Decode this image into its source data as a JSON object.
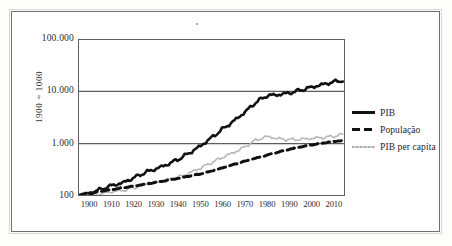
{
  "chart_data": {
    "type": "line",
    "title": "",
    "xlabel": "",
    "ylabel": "1900 = 1000",
    "y_scale": "log",
    "grid": true,
    "legend_position": "right",
    "xlim": [
      1895,
      2015
    ],
    "ylim": [
      100,
      100000
    ],
    "y_ticks": [
      100,
      1000,
      10000,
      100000
    ],
    "y_tick_labels": [
      "100",
      "1.000",
      "10.000",
      "100.000"
    ],
    "x_ticks": [
      1900,
      1910,
      1920,
      1930,
      1940,
      1950,
      1960,
      1970,
      1980,
      1990,
      2000,
      2010
    ],
    "x_tick_labels": [
      "1900",
      "1910",
      "1920",
      "1930",
      "1940",
      "1950",
      "1960",
      "1970",
      "1980",
      "1990",
      "2000",
      "2010"
    ],
    "series": [
      {
        "name": "PIB",
        "style": "solid",
        "color": "#111111",
        "width": 2.6,
        "x": [
          1895,
          1900,
          1905,
          1910,
          1915,
          1920,
          1925,
          1930,
          1935,
          1940,
          1945,
          1950,
          1955,
          1960,
          1965,
          1970,
          1975,
          1980,
          1985,
          1990,
          1995,
          2000,
          2005,
          2010,
          2014
        ],
        "values": [
          102,
          112,
          133,
          158,
          178,
          222,
          280,
          330,
          398,
          500,
          660,
          900,
          1300,
          1900,
          2700,
          4000,
          6200,
          8300,
          8600,
          9300,
          10500,
          12000,
          13500,
          15200,
          16200
        ]
      },
      {
        "name": "População",
        "style": "dashed",
        "color": "#111111",
        "width": 3.0,
        "x": [
          1895,
          1900,
          1905,
          1910,
          1915,
          1920,
          1925,
          1930,
          1935,
          1940,
          1945,
          1950,
          1955,
          1960,
          1965,
          1970,
          1975,
          1980,
          1985,
          1990,
          1995,
          2000,
          2005,
          2010,
          2014
        ],
        "values": [
          104,
          112,
          122,
          133,
          143,
          155,
          168,
          183,
          199,
          218,
          240,
          264,
          300,
          345,
          400,
          462,
          530,
          605,
          690,
          780,
          868,
          950,
          1030,
          1100,
          1150
        ]
      },
      {
        "name": "PIB per capita",
        "style": "thin",
        "color": "#b8b8b8",
        "width": 1.6,
        "x": [
          1895,
          1900,
          1905,
          1910,
          1915,
          1920,
          1925,
          1930,
          1935,
          1940,
          1945,
          1950,
          1955,
          1960,
          1965,
          1970,
          1975,
          1980,
          1985,
          1990,
          1995,
          2000,
          2005,
          2010,
          2014
        ],
        "values": [
          100,
          103,
          110,
          120,
          127,
          143,
          167,
          180,
          200,
          229,
          275,
          341,
          433,
          551,
          675,
          866,
          1170,
          1372,
          1246,
          1192,
          1210,
          1263,
          1311,
          1382,
          1520
        ]
      }
    ]
  },
  "axis": {
    "y_title": "1900 = 1000"
  },
  "legend": {
    "items": [
      {
        "label": "PIB",
        "key": "solid-line-key"
      },
      {
        "label": "População",
        "key": "dashed-line-key"
      },
      {
        "label": "PIB per capita",
        "key": "thin-line-key"
      }
    ]
  }
}
